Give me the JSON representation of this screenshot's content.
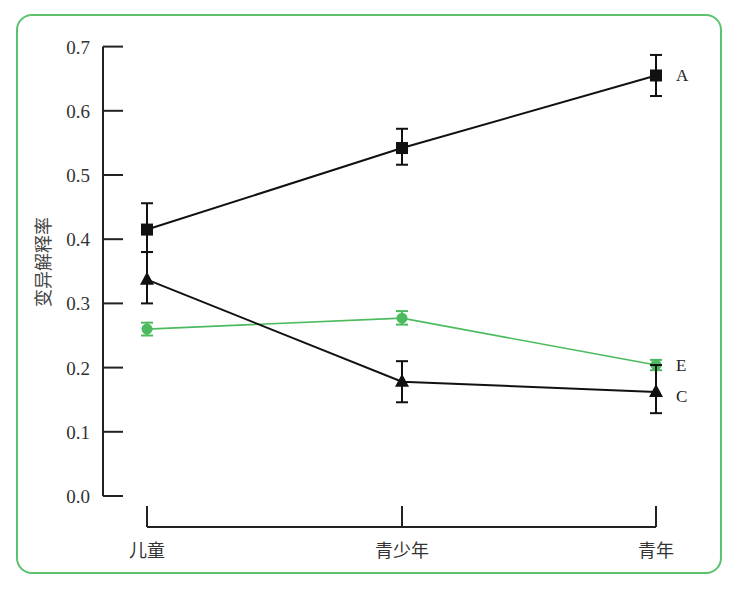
{
  "chart_data": {
    "type": "line",
    "title": "",
    "xlabel": "",
    "ylabel": "变异解释率",
    "ylim": [
      0,
      0.7
    ],
    "yticks": [
      "0.0",
      "0.1",
      "0.2",
      "0.3",
      "0.4",
      "0.5",
      "0.6",
      "0.7"
    ],
    "categories": [
      "儿童",
      "青少年",
      "青年"
    ],
    "grid": false,
    "legend_position": "inline-right",
    "series": [
      {
        "name": "A",
        "marker": "square",
        "color": "#111111",
        "values": [
          0.415,
          0.542,
          0.655
        ],
        "err_low": [
          0.38,
          0.516,
          0.623
        ],
        "err_high": [
          0.456,
          0.572,
          0.687
        ]
      },
      {
        "name": "E",
        "marker": "circle",
        "color": "#4cbb5f",
        "values": [
          0.26,
          0.277,
          0.204
        ],
        "err_low": [
          0.25,
          0.267,
          0.196
        ],
        "err_high": [
          0.27,
          0.288,
          0.212
        ]
      },
      {
        "name": "C",
        "marker": "triangle",
        "color": "#111111",
        "values": [
          0.337,
          0.178,
          0.162
        ],
        "err_low": [
          0.3,
          0.146,
          0.129
        ],
        "err_high": [
          0.38,
          0.21,
          0.204
        ]
      }
    ]
  },
  "colors": {
    "frame": "#5cc26e",
    "axis": "#222222"
  }
}
